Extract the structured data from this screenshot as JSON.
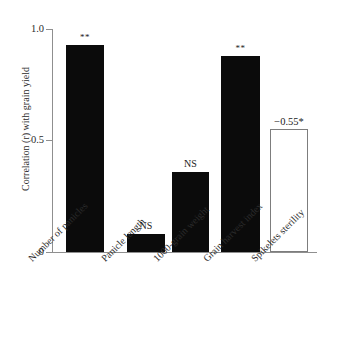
{
  "chart_data": {
    "type": "bar",
    "title": "",
    "xlabel": "",
    "ylabel": "Correlation (r) with grain yield",
    "ylim": [
      0,
      1.0
    ],
    "grid": false,
    "legend": "none",
    "y_ticks": [
      "0",
      "0.5",
      "1.0"
    ],
    "y_tick_values": [
      0,
      0.5,
      1.0
    ],
    "categories": [
      "Number of panicles",
      "Panicle length",
      "1000-grain weight",
      "Grain harvest index",
      "Spikelets sterility"
    ],
    "values": [
      0.93,
      0.08,
      0.36,
      0.88,
      0.55
    ],
    "signed_values": [
      0.93,
      0.08,
      0.36,
      0.88,
      -0.55
    ],
    "annotations": [
      "**",
      "NS",
      "NS",
      "**",
      "−0.55*"
    ],
    "bar_styles": [
      "filled",
      "filled",
      "filled",
      "filled",
      "hollow"
    ],
    "colors": {
      "bar_fill": "#0b0b0b",
      "bar_outline": "#7d7d7d",
      "axis": "#8f8f8f",
      "text": "#2b2b2b",
      "background": "#ffffff"
    }
  }
}
